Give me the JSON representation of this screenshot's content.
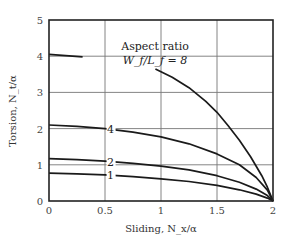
{
  "chart_data": {
    "type": "line",
    "title": "",
    "xlabel": "Sliding, N_x/α",
    "ylabel": "Torsion, N_t/α",
    "xlim": [
      0,
      2
    ],
    "ylim": [
      0,
      5
    ],
    "xticks": [
      "0",
      "0.5",
      "1",
      "1.5",
      "2"
    ],
    "yticks": [
      "0",
      "1",
      "2",
      "3",
      "4",
      "5"
    ],
    "grid": true,
    "annotation": {
      "line1": "Aspect ratio",
      "line2": "W_f/L_f = 8"
    },
    "series": [
      {
        "name": "8",
        "label": "8",
        "segments": [
          {
            "x": [
              0.0,
              0.3
            ],
            "y": [
              4.05,
              3.98
            ]
          },
          {
            "x": [
              0.95,
              1.1,
              1.25,
              1.4,
              1.5,
              1.6,
              1.7,
              1.8,
              1.9,
              1.95,
              2.0
            ],
            "y": [
              3.65,
              3.42,
              3.13,
              2.75,
              2.45,
              2.08,
              1.68,
              1.22,
              0.7,
              0.38,
              0.0
            ]
          }
        ]
      },
      {
        "name": "4",
        "label": "4",
        "segments": [
          {
            "x": [
              0.0,
              0.25,
              0.5,
              0.75,
              1.0,
              1.25,
              1.5,
              1.7,
              1.85,
              1.95,
              2.0
            ],
            "y": [
              2.1,
              2.06,
              2.0,
              1.9,
              1.77,
              1.58,
              1.3,
              1.0,
              0.65,
              0.3,
              0.0
            ]
          }
        ]
      },
      {
        "name": "2",
        "label": "2",
        "segments": [
          {
            "x": [
              0.0,
              0.25,
              0.5,
              0.75,
              1.0,
              1.25,
              1.5,
              1.7,
              1.85,
              1.95,
              2.0
            ],
            "y": [
              1.17,
              1.14,
              1.1,
              1.04,
              0.96,
              0.86,
              0.7,
              0.52,
              0.33,
              0.15,
              0.0
            ]
          }
        ]
      },
      {
        "name": "1",
        "label": "1",
        "segments": [
          {
            "x": [
              0.0,
              0.25,
              0.5,
              0.75,
              1.0,
              1.25,
              1.5,
              1.7,
              1.85,
              1.95,
              2.0
            ],
            "y": [
              0.77,
              0.75,
              0.72,
              0.67,
              0.61,
              0.54,
              0.43,
              0.31,
              0.19,
              0.08,
              0.0
            ]
          }
        ]
      }
    ]
  }
}
